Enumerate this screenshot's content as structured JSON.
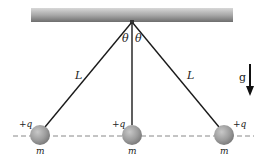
{
  "diagram": {
    "type": "three-charged-pendulums",
    "ceiling": {
      "color_dark": "#7a7a7a",
      "color_light": "#d6d6d6"
    },
    "labels": {
      "theta_left": "θ",
      "theta_right": "θ",
      "length_left": "L",
      "length_right": "L",
      "gravity": "g",
      "charge_left": "+q",
      "charge_center": "+q",
      "charge_right": "+q",
      "mass_left": "m",
      "mass_center": "m",
      "mass_right": "m"
    },
    "colors": {
      "string": "#1a1a1a",
      "ball": "#9a9a9a",
      "dashed_line": "#888888",
      "arrow": "#111111"
    }
  }
}
